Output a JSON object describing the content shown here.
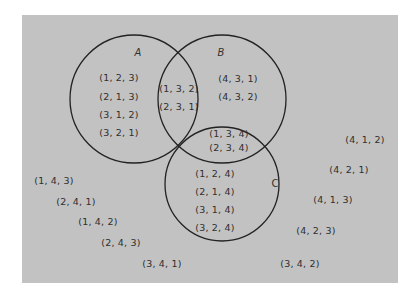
{
  "diagram": {
    "type": "venn",
    "colors": {
      "background": "#ffffff",
      "panel": "#c2c2c2",
      "stroke": "#222222",
      "text": "#2f2f2f"
    },
    "sets": [
      {
        "name": "A",
        "cx": 134,
        "cy": 99,
        "r": 64,
        "label_x": 138,
        "label_y": 52
      },
      {
        "name": "B",
        "cx": 222,
        "cy": 99,
        "r": 64,
        "label_x": 221,
        "label_y": 52
      },
      {
        "name": "C",
        "cx": 222,
        "cy": 184,
        "r": 57,
        "label_x": 275,
        "label_y": 183
      }
    ],
    "regions": {
      "A_only": [
        {
          "text": "(1, 2, 3)",
          "x": 119,
          "y": 77
        },
        {
          "text": "(2, 1, 3)",
          "x": 119,
          "y": 96
        },
        {
          "text": "(3, 1, 2)",
          "x": 119,
          "y": 114
        },
        {
          "text": "(3, 2, 1)",
          "x": 119,
          "y": 132
        }
      ],
      "A_and_B": [
        {
          "text": "(1, 3, 2)",
          "x": 179,
          "y": 88
        },
        {
          "text": "(2, 3, 1)",
          "x": 179,
          "y": 106
        }
      ],
      "B_only": [
        {
          "text": "(4, 3, 1)",
          "x": 238,
          "y": 78
        },
        {
          "text": "(4, 3, 2)",
          "x": 238,
          "y": 96
        }
      ],
      "B_and_C": [
        {
          "text": "(1, 3, 4)",
          "x": 229,
          "y": 133
        },
        {
          "text": "(2, 3, 4)",
          "x": 229,
          "y": 147
        }
      ],
      "C_only": [
        {
          "text": "(1, 2, 4)",
          "x": 215,
          "y": 173
        },
        {
          "text": "(2, 1, 4)",
          "x": 215,
          "y": 191
        },
        {
          "text": "(3, 1, 4)",
          "x": 215,
          "y": 209
        },
        {
          "text": "(3, 2, 4)",
          "x": 215,
          "y": 227
        }
      ],
      "outside": [
        {
          "text": "(1, 4, 3)",
          "x": 54,
          "y": 180
        },
        {
          "text": "(2, 4, 1)",
          "x": 76,
          "y": 201
        },
        {
          "text": "(1, 4, 2)",
          "x": 98,
          "y": 221
        },
        {
          "text": "(2, 4, 3)",
          "x": 121,
          "y": 242
        },
        {
          "text": "(3, 4, 1)",
          "x": 162,
          "y": 263
        },
        {
          "text": "(4, 1, 2)",
          "x": 365,
          "y": 139
        },
        {
          "text": "(4, 2, 1)",
          "x": 349,
          "y": 169
        },
        {
          "text": "(4, 1, 3)",
          "x": 333,
          "y": 199
        },
        {
          "text": "(4, 2, 3)",
          "x": 316,
          "y": 230
        },
        {
          "text": "(3, 4, 2)",
          "x": 300,
          "y": 263
        }
      ]
    }
  }
}
